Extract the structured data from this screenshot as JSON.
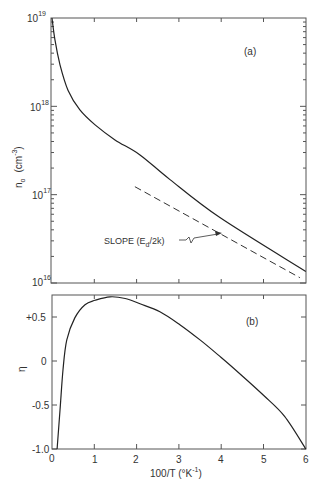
{
  "chart_data": [
    {
      "panel": "(a)",
      "type": "line",
      "yscale": "log",
      "xlabel": "100/T (°K⁻¹)",
      "ylabel": "n₀ (cm⁻³)",
      "xlim": [
        0,
        6
      ],
      "ylim": [
        1e+16,
        1e+19
      ],
      "x_ticks": [
        0,
        1,
        2,
        3,
        4,
        5,
        6
      ],
      "y_tick_labels": [
        "10^16",
        "10^17",
        "10^18",
        "10^19"
      ],
      "grid": false,
      "series": [
        {
          "name": "n0",
          "style": "solid",
          "x": [
            0.0,
            0.07,
            0.19,
            0.38,
            0.66,
            1.02,
            1.49,
            2.08,
            2.79,
            3.97,
            6.0
          ],
          "log10_y": [
            19.0,
            18.75,
            18.47,
            18.18,
            17.96,
            17.79,
            17.62,
            17.45,
            17.17,
            16.74,
            16.13
          ]
        },
        {
          "name": "slope (Ed/2k)",
          "style": "dashed",
          "x": [
            1.96,
            5.86
          ],
          "log10_y": [
            17.09,
            16.06
          ]
        }
      ],
      "annotations": [
        {
          "text": "SLOPE (Ed/2k)",
          "arrow_to": [
            4.05,
            16.58
          ]
        }
      ]
    },
    {
      "panel": "(b)",
      "type": "line",
      "xlabel": "100/T (°K⁻¹)",
      "ylabel": "η",
      "xlim": [
        0,
        6
      ],
      "ylim": [
        -1.0,
        0.75
      ],
      "x_ticks": [
        0,
        1,
        2,
        3,
        4,
        5,
        6
      ],
      "y_ticks": [
        -1.0,
        -0.5,
        0,
        0.5
      ],
      "y_tick_labels": [
        "-1.0",
        "-0.5",
        "0",
        "+0.5"
      ],
      "grid": false,
      "series": [
        {
          "name": "eta",
          "style": "solid",
          "x": [
            0.12,
            0.19,
            0.26,
            0.35,
            0.54,
            0.78,
            1.02,
            1.37,
            1.73,
            2.08,
            2.55,
            3.03,
            3.5,
            4.0,
            4.5,
            5.0,
            5.5,
            6.0
          ],
          "y": [
            -1.0,
            -0.56,
            -0.1,
            0.24,
            0.49,
            0.64,
            0.69,
            0.73,
            0.71,
            0.65,
            0.56,
            0.41,
            0.24,
            0.04,
            -0.17,
            -0.39,
            -0.63,
            -1.0
          ]
        }
      ]
    }
  ],
  "labels": {
    "panel_a": "(a)",
    "panel_b": "(b)",
    "ylabel_top_main": "n",
    "ylabel_top_sub": "o",
    "ylabel_top_unit": "(cm",
    "ylabel_top_exp": "-3",
    "ylabel_top_close": ")",
    "ylabel_bottom": "η",
    "xlabel_main": "100/T (°K",
    "xlabel_exp": "-1",
    "xlabel_close": ")",
    "annotation_main": "SLOPE (E",
    "annotation_sub": "d",
    "annotation_tail": "/2k)",
    "x_tick_labels": [
      "0",
      "1",
      "2",
      "3",
      "4",
      "5",
      "6"
    ],
    "y_top_base": "10",
    "y_top_exps": [
      "19",
      "18",
      "17",
      "16"
    ],
    "y_bottom_ticks": [
      "+0.5",
      "0",
      "-0.5",
      "-1.0"
    ]
  }
}
